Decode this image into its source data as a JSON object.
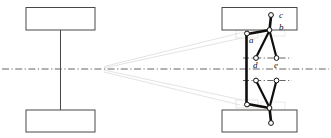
{
  "figure": {
    "type": "technical-line-diagram",
    "background_color": "#ffffff",
    "line_color": "#3c3a38",
    "heavy_link_color": "#100e0c",
    "guide_line_color": "#d8d8d8",
    "centerline_color": "#55534f",
    "joint_fill": "#ffffff"
  },
  "left_view": {
    "name": "axle-front-view",
    "wheels": [
      {
        "name": "wheel-upper-left",
        "x": 26,
        "y": 7,
        "w": 69,
        "h": 23
      },
      {
        "name": "wheel-lower-left",
        "x": 26,
        "y": 110,
        "w": 69,
        "h": 22
      }
    ],
    "axle": {
      "name": "axle-shaft",
      "x": 60,
      "y1": 30,
      "y2": 110
    }
  },
  "right_view": {
    "name": "suspension-side-view",
    "wheels": [
      {
        "name": "wheel-upper-right",
        "x": 222,
        "y": 7,
        "w": 75,
        "h": 23
      },
      {
        "name": "wheel-lower-right",
        "x": 222,
        "y": 110,
        "w": 75,
        "h": 22
      }
    ],
    "upright": {
      "name": "upright-strut",
      "x": 246,
      "y1": 34,
      "y2": 104
    },
    "links_upper": [
      {
        "name": "link-b-to-c",
        "x1": 269,
        "y1": 30,
        "x2": 271,
        "y2": 16
      },
      {
        "name": "link-a-to-b",
        "x1": 247,
        "y1": 34,
        "x2": 269,
        "y2": 30
      },
      {
        "name": "link-b-to-d",
        "x1": 269,
        "y1": 30,
        "x2": 256,
        "y2": 58
      },
      {
        "name": "link-b-to-e",
        "x1": 269,
        "y1": 30,
        "x2": 276,
        "y2": 58
      }
    ],
    "links_lower": [
      {
        "name": "link-lower-knuckle-to-wheel",
        "x1": 269,
        "y1": 108,
        "x2": 271,
        "y2": 122
      },
      {
        "name": "link-lower-arm",
        "x1": 247,
        "y1": 104,
        "x2": 269,
        "y2": 108
      },
      {
        "name": "link-lower-left-strut",
        "x1": 269,
        "y1": 108,
        "x2": 256,
        "y2": 80
      },
      {
        "name": "link-lower-right-strut",
        "x1": 269,
        "y1": 108,
        "x2": 276,
        "y2": 80
      }
    ]
  },
  "joint_labels": [
    {
      "id": "c",
      "text": "c",
      "x": 279,
      "y": 17,
      "joint_x": 271,
      "joint_y": 15
    },
    {
      "id": "b",
      "text": "b",
      "x": 279,
      "y": 29,
      "joint_x": 269,
      "joint_y": 30
    },
    {
      "id": "a",
      "text": "a",
      "x": 250,
      "y": 42,
      "joint_x": 247,
      "joint_y": 34
    },
    {
      "id": "d",
      "text": "d",
      "x": 254,
      "y": 66,
      "joint_x": 256,
      "joint_y": 58
    },
    {
      "id": "e",
      "text": "e",
      "x": 275,
      "y": 66,
      "joint_x": 276,
      "joint_y": 58
    }
  ],
  "joints_unlabeled": [
    {
      "name": "joint-lower-c",
      "x": 271,
      "y": 123
    },
    {
      "name": "joint-lower-b",
      "x": 269,
      "y": 108
    },
    {
      "name": "joint-lower-a",
      "x": 247,
      "y": 104
    },
    {
      "name": "joint-lower-d",
      "x": 256,
      "y": 80
    },
    {
      "name": "joint-lower-e",
      "x": 276,
      "y": 80
    }
  ],
  "centerlines": [
    {
      "name": "main-centerline",
      "x1": 2,
      "y1": 69,
      "x2": 329,
      "y2": 69
    },
    {
      "name": "upper-hub-centerline",
      "x1": 243,
      "y1": 58,
      "x2": 292,
      "y2": 58
    },
    {
      "name": "lower-hub-centerline",
      "x1": 243,
      "y1": 80,
      "x2": 292,
      "y2": 80
    }
  ],
  "guide_lines": [
    {
      "name": "perspective-guide-upper",
      "x1": 104,
      "y1": 66,
      "x2": 240,
      "y2": 34
    },
    {
      "name": "perspective-guide-upper-2",
      "x1": 104,
      "y1": 68,
      "x2": 240,
      "y2": 40
    },
    {
      "name": "perspective-guide-lower",
      "x1": 104,
      "y1": 72,
      "x2": 240,
      "y2": 104
    },
    {
      "name": "perspective-guide-lower-2",
      "x1": 104,
      "y1": 70,
      "x2": 240,
      "y2": 98
    }
  ],
  "guide_boxes": [
    {
      "name": "guide-box-upper-arm",
      "x": 236,
      "y": 30,
      "w": 22,
      "h": 8
    },
    {
      "name": "guide-box-lower-arm",
      "x": 236,
      "y": 100,
      "w": 22,
      "h": 8
    },
    {
      "name": "guide-box-upper-hub",
      "x": 262,
      "y": 26,
      "w": 22,
      "h": 10
    },
    {
      "name": "guide-box-lower-hub",
      "x": 262,
      "y": 102,
      "w": 22,
      "h": 10
    }
  ]
}
